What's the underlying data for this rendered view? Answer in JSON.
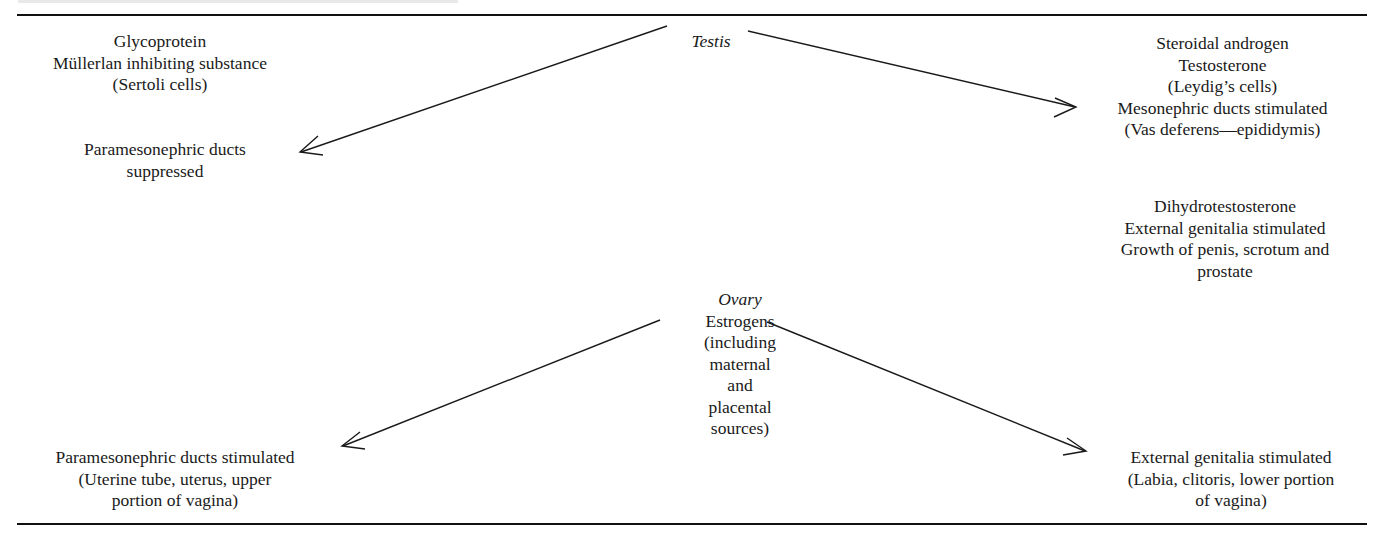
{
  "diagram": {
    "type": "flow",
    "header_partial_text_visible": false,
    "nodes": {
      "testis": {
        "title": "Testis"
      },
      "glycoprotein": {
        "lines": [
          "Glycoprotein",
          "Müllerlan inhibiting substance",
          "(Sertoli cells)"
        ]
      },
      "paramesonephric_suppressed": {
        "lines": [
          "Paramesonephric ducts",
          "suppressed"
        ]
      },
      "steroidal_androgen": {
        "lines": [
          "Steroidal androgen",
          "Testosterone",
          "(Leydig’s cells)",
          "Mesonephric ducts stimulated",
          "(Vas deferens—epididymis)"
        ]
      },
      "dihydrotestosterone": {
        "lines": [
          "Dihydrotestosterone",
          "External genitalia stimulated",
          "Growth of penis, scrotum and",
          "prostate"
        ]
      },
      "ovary": {
        "title": "Ovary",
        "lines": [
          "Estrogens",
          "(including",
          "maternal",
          "and",
          "placental",
          "sources)"
        ]
      },
      "paramesonephric_stimulated": {
        "lines": [
          "Paramesonephric ducts stimulated",
          "(Uterine tube, uterus, upper",
          "portion of vagina)"
        ]
      },
      "external_genitalia_female": {
        "lines": [
          "External genitalia stimulated",
          "(Labia, clitoris, lower portion",
          "of vagina)"
        ]
      }
    },
    "edges": [
      {
        "from": "testis",
        "to": "paramesonephric_suppressed"
      },
      {
        "from": "testis",
        "to": "steroidal_androgen"
      },
      {
        "from": "ovary",
        "to": "paramesonephric_stimulated"
      },
      {
        "from": "ovary",
        "to": "external_genitalia_female"
      }
    ],
    "colors": {
      "ink": "#1a1a1a",
      "background": "#ffffff",
      "rule": "#111111"
    }
  }
}
